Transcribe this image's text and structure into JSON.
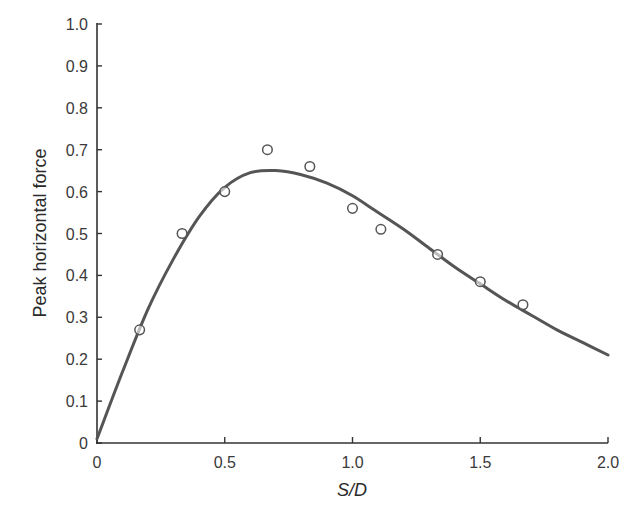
{
  "chart_data": {
    "type": "line",
    "title": "",
    "xlabel": "S/D",
    "ylabel": "Peak horizontal force",
    "xlim": [
      0,
      2.0
    ],
    "ylim": [
      0,
      1.0
    ],
    "grid": false,
    "legend": null,
    "x_ticks": [
      {
        "value": 0,
        "label": "0"
      },
      {
        "value": 0.5,
        "label": "0.5"
      },
      {
        "value": 1.0,
        "label": "1.0"
      },
      {
        "value": 1.5,
        "label": "1.5"
      },
      {
        "value": 2.0,
        "label": "2.0"
      }
    ],
    "y_ticks": [
      {
        "value": 0,
        "label": "0"
      },
      {
        "value": 0.1,
        "label": "0.1"
      },
      {
        "value": 0.2,
        "label": "0.2"
      },
      {
        "value": 0.3,
        "label": "0.3"
      },
      {
        "value": 0.4,
        "label": "0.4"
      },
      {
        "value": 0.5,
        "label": "0.5"
      },
      {
        "value": 0.6,
        "label": "0.6"
      },
      {
        "value": 0.7,
        "label": "0.7"
      },
      {
        "value": 0.8,
        "label": "0.8"
      },
      {
        "value": 0.9,
        "label": "0.9"
      },
      {
        "value": 1.0,
        "label": "1.0"
      }
    ],
    "series": [
      {
        "name": "Fitted curve",
        "kind": "line",
        "color": "#555555",
        "x": [
          0,
          0.1,
          0.2,
          0.3,
          0.4,
          0.5,
          0.6,
          0.7,
          0.8,
          0.9,
          1.0,
          1.1,
          1.2,
          1.3,
          1.4,
          1.5,
          1.6,
          1.7,
          1.8,
          1.9,
          2.0
        ],
        "y": [
          0.01,
          0.17,
          0.32,
          0.44,
          0.54,
          0.61,
          0.645,
          0.65,
          0.64,
          0.62,
          0.59,
          0.55,
          0.51,
          0.465,
          0.42,
          0.38,
          0.34,
          0.305,
          0.27,
          0.24,
          0.21
        ]
      },
      {
        "name": "Measured",
        "kind": "scatter",
        "marker": "open-circle",
        "color": "#555555",
        "x": [
          0.167,
          0.333,
          0.5,
          0.667,
          0.833,
          1.0,
          1.111,
          1.333,
          1.5,
          1.667
        ],
        "y": [
          0.27,
          0.5,
          0.6,
          0.7,
          0.66,
          0.56,
          0.51,
          0.45,
          0.385,
          0.33
        ]
      }
    ]
  },
  "plot_area": {
    "left": 97,
    "right": 608,
    "top": 24,
    "bottom": 443
  }
}
